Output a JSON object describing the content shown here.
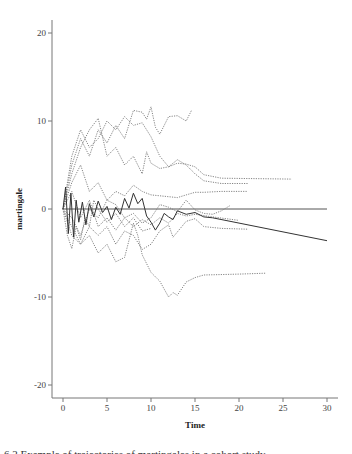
{
  "chart_data": {
    "type": "line",
    "title": "",
    "xlabel": "Time",
    "ylabel": "martingale",
    "xlim": [
      -1.2,
      31.5
    ],
    "ylim": [
      -21.5,
      21.5
    ],
    "xticks": [
      0,
      5,
      10,
      15,
      20,
      25,
      30
    ],
    "yticks": [
      -20,
      -10,
      0,
      10,
      20
    ],
    "grid": false,
    "legend": null,
    "reference_line": {
      "y": 0,
      "x_range": [
        0,
        30
      ]
    },
    "series": [
      {
        "name": "solid",
        "style": "solid",
        "color": "#333333",
        "points": [
          [
            0,
            0
          ],
          [
            0.3,
            2.5
          ],
          [
            0.6,
            -2.8
          ],
          [
            0.9,
            1.8
          ],
          [
            1.2,
            -3.2
          ],
          [
            1.5,
            1.0
          ],
          [
            1.8,
            -1.5
          ],
          [
            2.2,
            0.8
          ],
          [
            2.6,
            -1.8
          ],
          [
            3.0,
            0.6
          ],
          [
            3.5,
            -0.9
          ],
          [
            4.0,
            0.9
          ],
          [
            4.5,
            -0.4
          ],
          [
            5.0,
            0.3
          ],
          [
            5.5,
            -1.2
          ],
          [
            6.0,
            0.2
          ],
          [
            6.5,
            -0.6
          ],
          [
            7.0,
            1.2
          ],
          [
            7.5,
            0.1
          ],
          [
            8.0,
            1.8
          ],
          [
            8.5,
            0.6
          ],
          [
            9.0,
            1.2
          ],
          [
            9.5,
            -0.8
          ],
          [
            10.0,
            -1.5
          ],
          [
            10.5,
            -2.4
          ],
          [
            11.0,
            -1.6
          ],
          [
            11.5,
            -0.5
          ],
          [
            12.0,
            -0.9
          ],
          [
            12.5,
            -1.2
          ],
          [
            13.0,
            -0.2
          ],
          [
            14.0,
            -0.6
          ],
          [
            15.0,
            -0.4
          ],
          [
            16.0,
            -0.9
          ],
          [
            17.0,
            -1.0
          ],
          [
            30.0,
            -3.6
          ]
        ]
      },
      {
        "name": "dotted-high",
        "style": "dotted",
        "color": "#777777",
        "points": [
          [
            0,
            0
          ],
          [
            1,
            5
          ],
          [
            2,
            8
          ],
          [
            3,
            6
          ],
          [
            4,
            9
          ],
          [
            5,
            7.5
          ],
          [
            6,
            9.5
          ],
          [
            7,
            8
          ],
          [
            8,
            11.2
          ],
          [
            9,
            11.0
          ],
          [
            9.5,
            10.2
          ],
          [
            10,
            11.6
          ],
          [
            10.5,
            9.3
          ],
          [
            11,
            8.5
          ],
          [
            12,
            10.5
          ],
          [
            13,
            10.6
          ],
          [
            14,
            10.0
          ],
          [
            14.6,
            11.2
          ]
        ]
      },
      {
        "name": "dotted-decline",
        "style": "dotted",
        "color": "#777777",
        "points": [
          [
            0,
            0
          ],
          [
            1,
            6
          ],
          [
            2,
            9
          ],
          [
            3,
            7
          ],
          [
            4,
            8
          ],
          [
            5,
            10
          ],
          [
            6,
            9
          ],
          [
            7,
            10.5
          ],
          [
            8,
            9.5
          ],
          [
            9,
            9.8
          ],
          [
            10,
            8.2
          ],
          [
            11,
            6.0
          ],
          [
            12,
            4.8
          ],
          [
            13,
            5.2
          ],
          [
            14,
            5.1
          ],
          [
            15,
            4.8
          ],
          [
            16,
            3.9
          ],
          [
            18,
            3.5
          ],
          [
            26,
            3.4
          ]
        ]
      },
      {
        "name": "dotted-mid",
        "style": "dotted",
        "color": "#777777",
        "points": [
          [
            0,
            0
          ],
          [
            1,
            4
          ],
          [
            2,
            7
          ],
          [
            3,
            9
          ],
          [
            4,
            10.3
          ],
          [
            5,
            6
          ],
          [
            6,
            7
          ],
          [
            7,
            5
          ],
          [
            8,
            6
          ],
          [
            9,
            4
          ],
          [
            9.5,
            6.5
          ],
          [
            10,
            5.2
          ],
          [
            11,
            4.6
          ],
          [
            12,
            4.8
          ],
          [
            13,
            5.6
          ],
          [
            14,
            5.0
          ],
          [
            15,
            4.0
          ],
          [
            16,
            3.2
          ],
          [
            18,
            2.9
          ],
          [
            21,
            2.9
          ]
        ]
      },
      {
        "name": "dotted-low-flat",
        "style": "dotted",
        "color": "#777777",
        "points": [
          [
            0,
            0
          ],
          [
            1,
            3
          ],
          [
            2,
            5
          ],
          [
            3,
            2
          ],
          [
            4,
            3
          ],
          [
            5,
            1
          ],
          [
            6,
            2
          ],
          [
            7,
            1.5
          ],
          [
            8,
            2.7
          ],
          [
            9,
            2.0
          ],
          [
            10,
            1.6
          ],
          [
            11,
            1.5
          ],
          [
            12,
            1.4
          ],
          [
            13,
            1.3
          ],
          [
            14,
            1.6
          ],
          [
            15,
            1.9
          ],
          [
            16,
            1.9
          ],
          [
            18,
            2.0
          ],
          [
            21,
            2.0
          ]
        ]
      },
      {
        "name": "dotted-neg-mid",
        "style": "dotted",
        "color": "#777777",
        "points": [
          [
            0,
            0
          ],
          [
            1,
            -3
          ],
          [
            2,
            -4
          ],
          [
            3,
            -2
          ],
          [
            4,
            -3
          ],
          [
            5,
            -2
          ],
          [
            6,
            -4
          ],
          [
            7,
            -2.5
          ],
          [
            8,
            -3
          ],
          [
            9,
            -4.6
          ],
          [
            10,
            -4.0
          ],
          [
            11,
            -2.5
          ],
          [
            12,
            -1.8
          ],
          [
            12.5,
            -3.2
          ],
          [
            13,
            -2.6
          ],
          [
            14,
            -1.4
          ],
          [
            15,
            -1.1
          ],
          [
            16,
            -2.0
          ],
          [
            18,
            -2.2
          ],
          [
            21,
            -2.3
          ]
        ]
      },
      {
        "name": "dotted-neg-deep",
        "style": "dotted",
        "color": "#777777",
        "points": [
          [
            0,
            0
          ],
          [
            1,
            -2
          ],
          [
            2,
            -4
          ],
          [
            3,
            -3
          ],
          [
            4,
            -5
          ],
          [
            5,
            -4
          ],
          [
            6,
            -6
          ],
          [
            7,
            -5.5
          ],
          [
            8,
            -1.6
          ],
          [
            8.5,
            -3
          ],
          [
            9,
            -5.2
          ],
          [
            10,
            -7.2
          ],
          [
            11,
            -8.2
          ],
          [
            12,
            -10.0
          ],
          [
            12.5,
            -9.5
          ],
          [
            13,
            -9.8
          ],
          [
            14,
            -8.3
          ],
          [
            15,
            -7.8
          ],
          [
            16,
            -7.5
          ],
          [
            20,
            -7.4
          ],
          [
            23,
            -7.3
          ]
        ]
      },
      {
        "name": "dotted-cross-up",
        "style": "dotted",
        "color": "#777777",
        "points": [
          [
            0,
            0
          ],
          [
            1,
            -1
          ],
          [
            2,
            -3
          ],
          [
            3,
            0
          ],
          [
            4,
            -1
          ],
          [
            5,
            1
          ],
          [
            6,
            0.5
          ],
          [
            7,
            -1
          ],
          [
            8,
            -0.5
          ],
          [
            9,
            -1.6
          ],
          [
            10,
            -1.0
          ],
          [
            11,
            0.5
          ],
          [
            12,
            0.2
          ],
          [
            13,
            -0.3
          ],
          [
            14,
            1.0
          ],
          [
            15,
            -0.1
          ],
          [
            16,
            -0.5
          ],
          [
            17,
            -0.6
          ],
          [
            18,
            -0.2
          ],
          [
            19,
            0.4
          ]
        ]
      },
      {
        "name": "dotted-cross-down",
        "style": "dotted",
        "color": "#777777",
        "points": [
          [
            0,
            0
          ],
          [
            1,
            2
          ],
          [
            2,
            -1
          ],
          [
            3,
            1
          ],
          [
            4,
            -2
          ],
          [
            5,
            -1
          ],
          [
            6,
            -2.4
          ],
          [
            7,
            -1
          ],
          [
            8,
            -2
          ],
          [
            9,
            -1.2
          ],
          [
            10,
            -1.8
          ],
          [
            11,
            -1.0
          ],
          [
            12,
            -1.6
          ],
          [
            13,
            -0.5
          ],
          [
            14,
            -0.8
          ],
          [
            15,
            -0.6
          ],
          [
            17,
            -0.9
          ],
          [
            20,
            -1.3
          ]
        ]
      },
      {
        "name": "dotted-extra",
        "style": "dotted",
        "color": "#777777",
        "points": [
          [
            0,
            0
          ],
          [
            0.5,
            -3
          ],
          [
            1,
            -4.5
          ],
          [
            1.5,
            -2
          ],
          [
            2,
            -3.5
          ],
          [
            2.5,
            -1
          ],
          [
            3,
            -2
          ],
          [
            3.5,
            1
          ],
          [
            4,
            0
          ],
          [
            5,
            -1.5
          ],
          [
            6,
            -0.5
          ],
          [
            7,
            -2
          ],
          [
            8,
            -1
          ],
          [
            9,
            -2.5
          ],
          [
            10,
            -2.2
          ]
        ]
      }
    ]
  },
  "axes": {
    "x_title": "Time",
    "y_title": "martingale",
    "x_tick_labels": [
      "0",
      "5",
      "10",
      "15",
      "20",
      "25",
      "30"
    ],
    "y_tick_labels": [
      "20",
      "10",
      "0",
      "-10",
      "-20"
    ]
  },
  "caption": {
    "text": "6.2 Example of trajectories of martingales in a cohort study"
  }
}
